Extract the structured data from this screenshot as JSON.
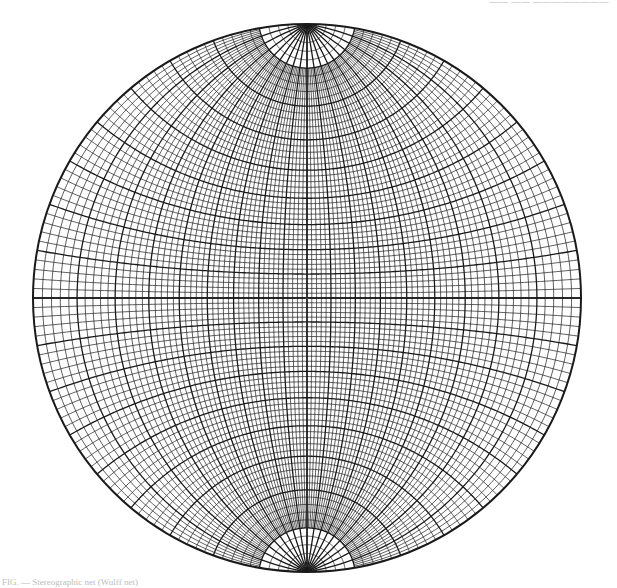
{
  "header": {
    "caption": "—— —— ————————"
  },
  "figure": {
    "caption": "FIG. — Stereographic net (Wulff net)",
    "type": "wulff-stereographic-net",
    "center_marker": "+",
    "line_color": "#1a1a1a",
    "background": "#ffffff",
    "grid_spacing_deg": 2,
    "major_spacing_deg": 10,
    "polar_cap_deg": 80
  },
  "geometry": {
    "cx": 307,
    "cy": 298,
    "r": 274
  }
}
